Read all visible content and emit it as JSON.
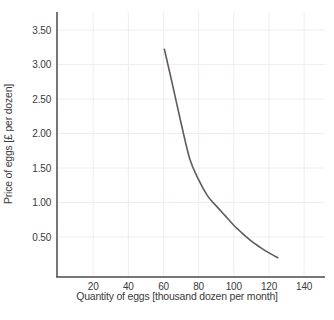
{
  "chart_data": {
    "type": "line",
    "title": "",
    "xlabel": "Quantity of eggs [thousand dozen per month]",
    "ylabel": "Price of eggs [£ per dozen]",
    "xlim": [
      0,
      152
    ],
    "ylim": [
      -0.08,
      3.76
    ],
    "grid": true,
    "legend_position": "none",
    "x_tick_values": [
      20,
      40,
      60,
      80,
      100,
      120,
      140
    ],
    "x_tick_labels": [
      "20",
      "40",
      "60",
      "80",
      "100",
      "120",
      "140"
    ],
    "y_tick_values": [
      0.5,
      1.0,
      1.5,
      2.0,
      2.5,
      3.0,
      3.5
    ],
    "y_tick_labels": [
      "0.50",
      "1.00",
      "1.50",
      "2.00",
      "2.50",
      "3.00",
      "3.50"
    ],
    "series": [
      {
        "name": "demand-curve",
        "x": [
          60.5,
          65,
          70,
          75,
          80,
          85,
          90,
          95,
          100,
          105,
          110,
          115,
          120,
          125
        ],
        "y": [
          3.22,
          2.72,
          2.15,
          1.63,
          1.33,
          1.1,
          0.95,
          0.81,
          0.67,
          0.55,
          0.44,
          0.35,
          0.27,
          0.2
        ]
      }
    ],
    "colors": {
      "curve": "#5d5d5d",
      "grid": "#f2ecec",
      "spine": "#4a4a4a",
      "tick_text": "#3a3a3a",
      "background": "#ffffff"
    }
  }
}
